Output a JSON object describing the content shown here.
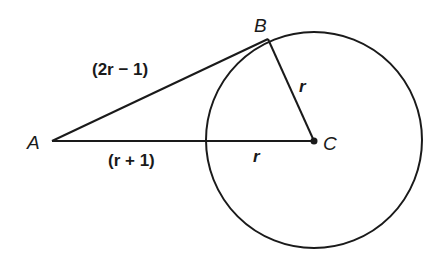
{
  "diagram": {
    "points": {
      "A": {
        "label": "A",
        "x": 52,
        "y": 141
      },
      "B": {
        "label": "B",
        "x": 268,
        "y": 39
      },
      "C": {
        "label": "C",
        "x": 314,
        "y": 141
      }
    },
    "circle": {
      "cx": 314,
      "cy": 140,
      "r": 108
    },
    "segments": {
      "AB": {
        "label": "(2r − 1)",
        "description": "tangent segment from A to B"
      },
      "AC_outside": {
        "label": "(r + 1)",
        "description": "segment from A to circle"
      },
      "AC_inside": {
        "label": "r",
        "description": "radius along AC"
      },
      "BC": {
        "label": "r",
        "description": "radius from B to C"
      }
    },
    "stroke_color": "#1a1a1a"
  }
}
